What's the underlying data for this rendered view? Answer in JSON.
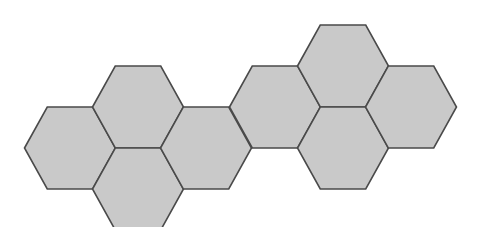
{
  "diagram": {
    "type": "hexagon-tiling",
    "hexagon_count": 8,
    "style": {
      "fill": "#c9c9c9",
      "stroke": "#4a4a4a",
      "stroke_width": 1.6,
      "background": "#ffffff"
    },
    "hex_size": {
      "width": 91,
      "height": 82
    },
    "hexagons": [
      {
        "id": "hex-1",
        "cx": 70,
        "cy": 148
      },
      {
        "id": "hex-2",
        "cx": 138,
        "cy": 107
      },
      {
        "id": "hex-3",
        "cx": 138,
        "cy": 189
      },
      {
        "id": "hex-4",
        "cx": 206,
        "cy": 148
      },
      {
        "id": "hex-5",
        "cx": 275,
        "cy": 107
      },
      {
        "id": "hex-6",
        "cx": 343,
        "cy": 66
      },
      {
        "id": "hex-7",
        "cx": 343,
        "cy": 148
      },
      {
        "id": "hex-8",
        "cx": 411,
        "cy": 107
      }
    ]
  }
}
